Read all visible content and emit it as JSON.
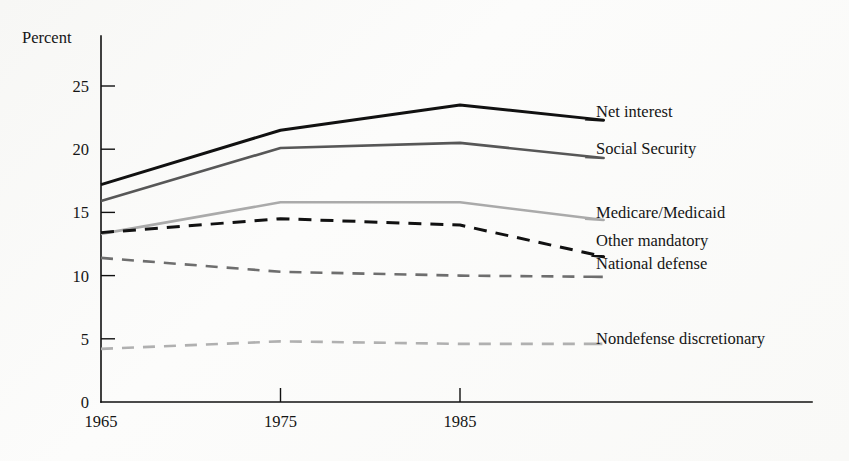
{
  "chart_data": {
    "type": "line",
    "title": "",
    "subtitle": "",
    "xlabel": "",
    "ylabel": "Percent",
    "xlim": [
      1965,
      1995
    ],
    "ylim": [
      0,
      27
    ],
    "grid": false,
    "legend_position": "right-inline-labels",
    "x_ticks": [
      1965,
      1975,
      1985
    ],
    "x_tick_labels": [
      "1965",
      "1975",
      "1985"
    ],
    "y_ticks": [
      0,
      5,
      10,
      15,
      20,
      25
    ],
    "y_tick_labels": [
      "0",
      "5",
      "10",
      "15",
      "20",
      "25"
    ],
    "x": [
      1965,
      1975,
      1985,
      1993
    ],
    "series": [
      {
        "name": "Net interest",
        "values": [
          17.2,
          21.5,
          23.5,
          22.3
        ],
        "color": "#111111",
        "width": 3.0,
        "dash": "none",
        "label_y": 23.0
      },
      {
        "name": "Social Security",
        "values": [
          15.9,
          20.1,
          20.5,
          19.3
        ],
        "color": "#575757",
        "width": 2.6,
        "dash": "none",
        "label_y": 20.1
      },
      {
        "name": "Medicare/Medicaid",
        "values": [
          13.3,
          15.8,
          15.8,
          14.4
        ],
        "color": "#aaaaaa",
        "width": 2.6,
        "dash": "none",
        "label_y": 15.0
      },
      {
        "name": "Other mandatory",
        "values": [
          13.4,
          14.5,
          14.0,
          11.5
        ],
        "color": "#111111",
        "width": 3.0,
        "dash": "13 9",
        "label_y": 12.8
      },
      {
        "name": "National defense",
        "values": [
          11.4,
          10.3,
          10.0,
          9.9
        ],
        "color": "#6e6e6e",
        "width": 2.6,
        "dash": "12 9",
        "label_y": 11.0
      },
      {
        "name": "Nondefense discretionary",
        "values": [
          4.2,
          4.8,
          4.6,
          4.6
        ],
        "color": "#b0b0b0",
        "width": 2.6,
        "dash": "12 9",
        "label_y": 5.1
      }
    ]
  },
  "axes": {
    "y_axis_label": "Percent",
    "origin_label": "0"
  }
}
